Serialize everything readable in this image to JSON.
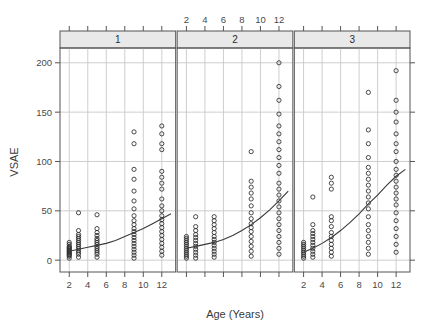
{
  "chart_data": {
    "type": "scatter",
    "title": "",
    "xlabel": "Age (Years)",
    "ylabel": "VSAE",
    "xlim": [
      1,
      13.5
    ],
    "ylim": [
      -12,
      215
    ],
    "xticks": [
      2,
      4,
      6,
      8,
      10,
      12
    ],
    "yticks": [
      0,
      50,
      100,
      150,
      200
    ],
    "xtick_labels": [
      "2",
      "4",
      "6",
      "8",
      "10",
      "12"
    ],
    "ytick_labels": [
      "0",
      "50",
      "100",
      "150",
      "200"
    ],
    "grid": "horizontal-and-vertical",
    "legend_position": "none",
    "conditioning_variable": "sicdegp",
    "panel_strips": [
      "1",
      "2",
      "3"
    ],
    "panel_axis_positions": {
      "top_labels_panel": 2,
      "bottom_labels_panels": [
        1,
        3
      ]
    },
    "panels": [
      {
        "strip": "1",
        "fit": {
          "type": "loess",
          "x": [
            2,
            3,
            4,
            5,
            6,
            7,
            8,
            9,
            10,
            11,
            12,
            13
          ],
          "y": [
            9,
            11,
            13,
            15,
            17,
            20,
            24,
            28,
            32,
            37,
            42,
            47
          ]
        },
        "points": [
          {
            "x": 2,
            "y": 2
          },
          {
            "x": 2,
            "y": 4
          },
          {
            "x": 2,
            "y": 5
          },
          {
            "x": 2,
            "y": 6
          },
          {
            "x": 2,
            "y": 7
          },
          {
            "x": 2,
            "y": 8
          },
          {
            "x": 2,
            "y": 9
          },
          {
            "x": 2,
            "y": 10
          },
          {
            "x": 2,
            "y": 11
          },
          {
            "x": 2,
            "y": 12
          },
          {
            "x": 2,
            "y": 13
          },
          {
            "x": 2,
            "y": 14
          },
          {
            "x": 2,
            "y": 16
          },
          {
            "x": 2,
            "y": 18
          },
          {
            "x": 3,
            "y": 3
          },
          {
            "x": 3,
            "y": 6
          },
          {
            "x": 3,
            "y": 8
          },
          {
            "x": 3,
            "y": 10
          },
          {
            "x": 3,
            "y": 12
          },
          {
            "x": 3,
            "y": 14
          },
          {
            "x": 3,
            "y": 16
          },
          {
            "x": 3,
            "y": 18
          },
          {
            "x": 3,
            "y": 20
          },
          {
            "x": 3,
            "y": 22
          },
          {
            "x": 3,
            "y": 24
          },
          {
            "x": 3,
            "y": 26
          },
          {
            "x": 3,
            "y": 30
          },
          {
            "x": 3,
            "y": 48
          },
          {
            "x": 5,
            "y": 3
          },
          {
            "x": 5,
            "y": 6
          },
          {
            "x": 5,
            "y": 8
          },
          {
            "x": 5,
            "y": 10
          },
          {
            "x": 5,
            "y": 12
          },
          {
            "x": 5,
            "y": 14
          },
          {
            "x": 5,
            "y": 16
          },
          {
            "x": 5,
            "y": 18
          },
          {
            "x": 5,
            "y": 20
          },
          {
            "x": 5,
            "y": 22
          },
          {
            "x": 5,
            "y": 25
          },
          {
            "x": 5,
            "y": 28
          },
          {
            "x": 5,
            "y": 32
          },
          {
            "x": 5,
            "y": 46
          },
          {
            "x": 9,
            "y": 2
          },
          {
            "x": 9,
            "y": 5
          },
          {
            "x": 9,
            "y": 8
          },
          {
            "x": 9,
            "y": 11
          },
          {
            "x": 9,
            "y": 14
          },
          {
            "x": 9,
            "y": 17
          },
          {
            "x": 9,
            "y": 20
          },
          {
            "x": 9,
            "y": 23
          },
          {
            "x": 9,
            "y": 26
          },
          {
            "x": 9,
            "y": 29
          },
          {
            "x": 9,
            "y": 32
          },
          {
            "x": 9,
            "y": 36
          },
          {
            "x": 9,
            "y": 40
          },
          {
            "x": 9,
            "y": 45
          },
          {
            "x": 9,
            "y": 52
          },
          {
            "x": 9,
            "y": 60
          },
          {
            "x": 9,
            "y": 70
          },
          {
            "x": 9,
            "y": 82
          },
          {
            "x": 9,
            "y": 92
          },
          {
            "x": 9,
            "y": 118
          },
          {
            "x": 9,
            "y": 130
          },
          {
            "x": 12,
            "y": 5
          },
          {
            "x": 12,
            "y": 9
          },
          {
            "x": 12,
            "y": 13
          },
          {
            "x": 12,
            "y": 17
          },
          {
            "x": 12,
            "y": 21
          },
          {
            "x": 12,
            "y": 25
          },
          {
            "x": 12,
            "y": 29
          },
          {
            "x": 12,
            "y": 33
          },
          {
            "x": 12,
            "y": 37
          },
          {
            "x": 12,
            "y": 41
          },
          {
            "x": 12,
            "y": 45
          },
          {
            "x": 12,
            "y": 50
          },
          {
            "x": 12,
            "y": 55
          },
          {
            "x": 12,
            "y": 62
          },
          {
            "x": 12,
            "y": 72
          },
          {
            "x": 12,
            "y": 78
          },
          {
            "x": 12,
            "y": 84
          },
          {
            "x": 12,
            "y": 90
          },
          {
            "x": 12,
            "y": 112
          },
          {
            "x": 12,
            "y": 118
          },
          {
            "x": 12,
            "y": 128
          },
          {
            "x": 12,
            "y": 136
          }
        ]
      },
      {
        "strip": "2",
        "fit": {
          "type": "loess",
          "x": [
            2,
            3,
            4,
            5,
            6,
            7,
            8,
            9,
            10,
            11,
            12,
            13
          ],
          "y": [
            12,
            14,
            16,
            18,
            21,
            25,
            30,
            36,
            43,
            51,
            60,
            70
          ]
        },
        "points": [
          {
            "x": 2,
            "y": 2
          },
          {
            "x": 2,
            "y": 4
          },
          {
            "x": 2,
            "y": 6
          },
          {
            "x": 2,
            "y": 8
          },
          {
            "x": 2,
            "y": 10
          },
          {
            "x": 2,
            "y": 12
          },
          {
            "x": 2,
            "y": 14
          },
          {
            "x": 2,
            "y": 16
          },
          {
            "x": 2,
            "y": 18
          },
          {
            "x": 2,
            "y": 20
          },
          {
            "x": 2,
            "y": 22
          },
          {
            "x": 2,
            "y": 24
          },
          {
            "x": 3,
            "y": 2
          },
          {
            "x": 3,
            "y": 5
          },
          {
            "x": 3,
            "y": 8
          },
          {
            "x": 3,
            "y": 11
          },
          {
            "x": 3,
            "y": 14
          },
          {
            "x": 3,
            "y": 17
          },
          {
            "x": 3,
            "y": 20
          },
          {
            "x": 3,
            "y": 23
          },
          {
            "x": 3,
            "y": 26
          },
          {
            "x": 3,
            "y": 30
          },
          {
            "x": 3,
            "y": 34
          },
          {
            "x": 3,
            "y": 44
          },
          {
            "x": 5,
            "y": 3
          },
          {
            "x": 5,
            "y": 6
          },
          {
            "x": 5,
            "y": 9
          },
          {
            "x": 5,
            "y": 12
          },
          {
            "x": 5,
            "y": 15
          },
          {
            "x": 5,
            "y": 18
          },
          {
            "x": 5,
            "y": 21
          },
          {
            "x": 5,
            "y": 24
          },
          {
            "x": 5,
            "y": 28
          },
          {
            "x": 5,
            "y": 32
          },
          {
            "x": 5,
            "y": 36
          },
          {
            "x": 5,
            "y": 40
          },
          {
            "x": 5,
            "y": 44
          },
          {
            "x": 9,
            "y": 4
          },
          {
            "x": 9,
            "y": 9
          },
          {
            "x": 9,
            "y": 14
          },
          {
            "x": 9,
            "y": 19
          },
          {
            "x": 9,
            "y": 24
          },
          {
            "x": 9,
            "y": 29
          },
          {
            "x": 9,
            "y": 33
          },
          {
            "x": 9,
            "y": 37
          },
          {
            "x": 9,
            "y": 42
          },
          {
            "x": 9,
            "y": 48
          },
          {
            "x": 9,
            "y": 55
          },
          {
            "x": 9,
            "y": 62
          },
          {
            "x": 9,
            "y": 68
          },
          {
            "x": 9,
            "y": 74
          },
          {
            "x": 9,
            "y": 80
          },
          {
            "x": 9,
            "y": 110
          },
          {
            "x": 12,
            "y": 6
          },
          {
            "x": 12,
            "y": 12
          },
          {
            "x": 12,
            "y": 18
          },
          {
            "x": 12,
            "y": 24
          },
          {
            "x": 12,
            "y": 30
          },
          {
            "x": 12,
            "y": 36
          },
          {
            "x": 12,
            "y": 42
          },
          {
            "x": 12,
            "y": 48
          },
          {
            "x": 12,
            "y": 54
          },
          {
            "x": 12,
            "y": 60
          },
          {
            "x": 12,
            "y": 66
          },
          {
            "x": 12,
            "y": 72
          },
          {
            "x": 12,
            "y": 78
          },
          {
            "x": 12,
            "y": 88
          },
          {
            "x": 12,
            "y": 96
          },
          {
            "x": 12,
            "y": 104
          },
          {
            "x": 12,
            "y": 112
          },
          {
            "x": 12,
            "y": 120
          },
          {
            "x": 12,
            "y": 128
          },
          {
            "x": 12,
            "y": 136
          },
          {
            "x": 12,
            "y": 148
          },
          {
            "x": 12,
            "y": 162
          },
          {
            "x": 12,
            "y": 176
          },
          {
            "x": 12,
            "y": 200
          }
        ]
      },
      {
        "strip": "3",
        "fit": {
          "type": "loess",
          "x": [
            2,
            3,
            4,
            5,
            6,
            7,
            8,
            9,
            10,
            11,
            12,
            13
          ],
          "y": [
            8,
            12,
            17,
            23,
            30,
            38,
            47,
            57,
            66,
            76,
            85,
            92
          ]
        },
        "points": [
          {
            "x": 2,
            "y": 2
          },
          {
            "x": 2,
            "y": 4
          },
          {
            "x": 2,
            "y": 6
          },
          {
            "x": 2,
            "y": 8
          },
          {
            "x": 2,
            "y": 10
          },
          {
            "x": 2,
            "y": 12
          },
          {
            "x": 2,
            "y": 14
          },
          {
            "x": 2,
            "y": 16
          },
          {
            "x": 2,
            "y": 18
          },
          {
            "x": 3,
            "y": 3
          },
          {
            "x": 3,
            "y": 6
          },
          {
            "x": 3,
            "y": 9
          },
          {
            "x": 3,
            "y": 12
          },
          {
            "x": 3,
            "y": 15
          },
          {
            "x": 3,
            "y": 18
          },
          {
            "x": 3,
            "y": 21
          },
          {
            "x": 3,
            "y": 24
          },
          {
            "x": 3,
            "y": 27
          },
          {
            "x": 3,
            "y": 30
          },
          {
            "x": 3,
            "y": 36
          },
          {
            "x": 3,
            "y": 64
          },
          {
            "x": 5,
            "y": 4
          },
          {
            "x": 5,
            "y": 8
          },
          {
            "x": 5,
            "y": 12
          },
          {
            "x": 5,
            "y": 16
          },
          {
            "x": 5,
            "y": 20
          },
          {
            "x": 5,
            "y": 24
          },
          {
            "x": 5,
            "y": 28
          },
          {
            "x": 5,
            "y": 34
          },
          {
            "x": 5,
            "y": 40
          },
          {
            "x": 5,
            "y": 44
          },
          {
            "x": 5,
            "y": 72
          },
          {
            "x": 5,
            "y": 78
          },
          {
            "x": 5,
            "y": 84
          },
          {
            "x": 9,
            "y": 6
          },
          {
            "x": 9,
            "y": 12
          },
          {
            "x": 9,
            "y": 18
          },
          {
            "x": 9,
            "y": 24
          },
          {
            "x": 9,
            "y": 30
          },
          {
            "x": 9,
            "y": 36
          },
          {
            "x": 9,
            "y": 44
          },
          {
            "x": 9,
            "y": 52
          },
          {
            "x": 9,
            "y": 58
          },
          {
            "x": 9,
            "y": 64
          },
          {
            "x": 9,
            "y": 70
          },
          {
            "x": 9,
            "y": 76
          },
          {
            "x": 9,
            "y": 82
          },
          {
            "x": 9,
            "y": 88
          },
          {
            "x": 9,
            "y": 94
          },
          {
            "x": 9,
            "y": 104
          },
          {
            "x": 9,
            "y": 118
          },
          {
            "x": 9,
            "y": 132
          },
          {
            "x": 9,
            "y": 170
          },
          {
            "x": 12,
            "y": 8
          },
          {
            "x": 12,
            "y": 16
          },
          {
            "x": 12,
            "y": 24
          },
          {
            "x": 12,
            "y": 32
          },
          {
            "x": 12,
            "y": 40
          },
          {
            "x": 12,
            "y": 48
          },
          {
            "x": 12,
            "y": 56
          },
          {
            "x": 12,
            "y": 62
          },
          {
            "x": 12,
            "y": 68
          },
          {
            "x": 12,
            "y": 74
          },
          {
            "x": 12,
            "y": 80
          },
          {
            "x": 12,
            "y": 86
          },
          {
            "x": 12,
            "y": 92
          },
          {
            "x": 12,
            "y": 100
          },
          {
            "x": 12,
            "y": 110
          },
          {
            "x": 12,
            "y": 118
          },
          {
            "x": 12,
            "y": 128
          },
          {
            "x": 12,
            "y": 140
          },
          {
            "x": 12,
            "y": 150
          },
          {
            "x": 12,
            "y": 162
          },
          {
            "x": 12,
            "y": 192
          }
        ]
      }
    ]
  },
  "axes": {
    "ylabel": "VSAE",
    "xlabel": "Age (Years)"
  }
}
